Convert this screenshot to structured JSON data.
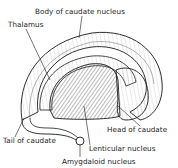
{
  "diagram": {
    "labels": {
      "body": "Body of caudate nucleus",
      "thalamus": "Thalamus",
      "head": "Head of caudate",
      "tail": "Tail of caudate",
      "lenticular": "Lenticular nucleus",
      "amygdaloid": "Amygdaloid nucleus"
    },
    "colors": {
      "ink": "#1a1a1a",
      "shade": "#8a8a8a",
      "background": "#ffffff"
    }
  }
}
